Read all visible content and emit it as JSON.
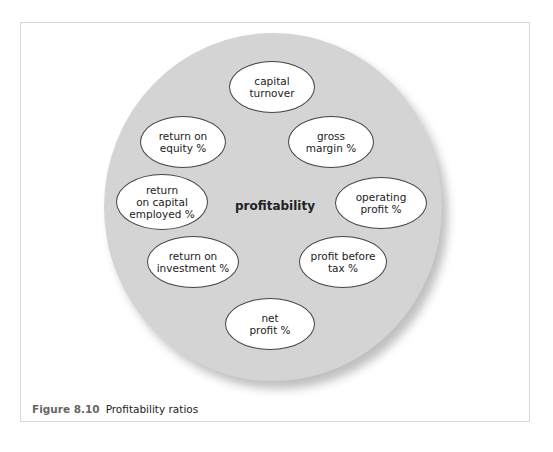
{
  "diagram": {
    "center_label": "profitability",
    "nodes": [
      {
        "id": "capital-turnover",
        "label": "capital\nturnover"
      },
      {
        "id": "return-on-equity",
        "label": "return on\nequity %"
      },
      {
        "id": "gross-margin",
        "label": "gross\nmargin %"
      },
      {
        "id": "return-on-capital-employed",
        "label": "return\non capital\nemployed %"
      },
      {
        "id": "operating-profit",
        "label": "operating\nprofit %"
      },
      {
        "id": "return-on-investment",
        "label": "return on\ninvestment %"
      },
      {
        "id": "profit-before-tax",
        "label": "profit before\ntax %"
      },
      {
        "id": "net-profit",
        "label": "net\nprofit %"
      }
    ]
  },
  "caption": {
    "number": "Figure 8.10",
    "title": "Profitability ratios"
  },
  "colors": {
    "circle_fill": "#d4d4d4",
    "node_fill": "#ffffff",
    "node_border": "#444444",
    "frame_border": "#d8d8d8"
  }
}
